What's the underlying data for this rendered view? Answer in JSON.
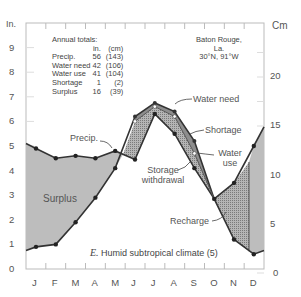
{
  "chart_data": {
    "type": "line",
    "title": "E. Humid subtropical climate (5)",
    "location": {
      "name": "Baton Rouge,",
      "state": "La.",
      "coords": "30°N, 91°W"
    },
    "xlabel": "",
    "ylabel_left": "In.",
    "ylabel_right": "Cm",
    "categories": [
      "J",
      "F",
      "M",
      "A",
      "M",
      "J",
      "J",
      "A",
      "S",
      "O",
      "N",
      "D"
    ],
    "ylim_in": [
      0,
      9.8
    ],
    "yticks_in": [
      0,
      1,
      2,
      3,
      4,
      5,
      6,
      7,
      8,
      9
    ],
    "yticks_cm": [
      0,
      5,
      10,
      15,
      20
    ],
    "series": [
      {
        "name": "Precip.",
        "values": [
          4.9,
          4.5,
          4.6,
          4.5,
          4.8,
          4.45,
          6.3,
          5.5,
          4.1,
          2.85,
          3.5,
          5.0
        ]
      },
      {
        "name": "Water need",
        "values": [
          0.9,
          1.0,
          1.9,
          2.9,
          4.1,
          6.2,
          6.75,
          6.4,
          5.2,
          2.85,
          1.2,
          0.6
        ]
      },
      {
        "name": "Water use",
        "values": [
          0.9,
          1.0,
          1.9,
          2.9,
          4.1,
          6.0,
          6.6,
          6.2,
          4.7,
          2.85,
          1.2,
          0.6
        ]
      }
    ],
    "annotations": [
      "Precip.",
      "Water need",
      "Shortage",
      "Water use",
      "Storage withdrawal",
      "Recharge",
      "Surplus"
    ],
    "annual_totals": {
      "header": "Annual totals:",
      "units": [
        "in.",
        "(cm)"
      ],
      "rows": [
        {
          "label": "Precip.",
          "in": "56",
          "cm": "(143)"
        },
        {
          "label": "Water need",
          "in": "42",
          "cm": "(106)"
        },
        {
          "label": "Water use",
          "in": "41",
          "cm": "(104)"
        },
        {
          "label": "Shortage",
          "in": "1",
          "cm": "(2)"
        },
        {
          "label": "Surplus",
          "in": "16",
          "cm": "(39)"
        }
      ]
    },
    "grid": false,
    "colors": {
      "surplus": "#bdbdbd",
      "withdrawal": "#a9a9a9",
      "line": "#333333",
      "axis": "#bbbbbb"
    }
  }
}
